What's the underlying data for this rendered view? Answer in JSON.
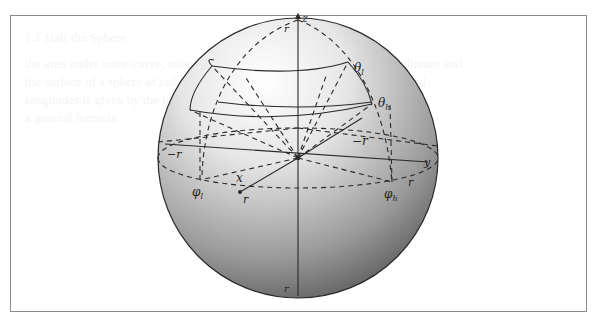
{
  "figure": {
    "labels": {
      "z_axis": "z",
      "north_pole": "r",
      "south_pole": "r",
      "theta_low": "θ",
      "theta_low_sub": "l",
      "theta_high": "θ",
      "theta_high_sub": "h",
      "neg_r_right": "−r",
      "neg_r_left": "−r",
      "x_axis": "x",
      "y_axis": "y",
      "r_front": "r",
      "r_right": "r",
      "phi_low": "φ",
      "phi_low_sub": "l",
      "phi_high": "φ",
      "phi_high_sub": "h"
    },
    "colors": {
      "line": "#2a2a2a",
      "frame": "#8a8a8a",
      "sphere_light": "#ffffff",
      "sphere_dark": "#555555"
    }
  },
  "background_ghost_text": [
    "1.1   Half the Sphere",
    "the area under some curve, using the standard notation for spherical coordinates and",
    "the surface of a sphere of radius r, the area of the patch between latitudes and",
    "longitudes is given by the integral shown below; this may be more than",
    "a general formula"
  ]
}
